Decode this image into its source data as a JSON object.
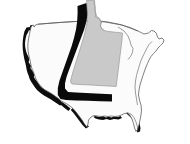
{
  "figure": {
    "title": "Map of the contiguous United States",
    "subject": "Idaho",
    "description": "Outline map of the contiguous United States with the state of Idaho shaded gray and offset with a heavy black drop shadow.",
    "width": 190,
    "height": 144,
    "background_color": "#ffffff"
  },
  "legend": {
    "nation_label": "Contiguous United States",
    "highlight_label": "Idaho",
    "shadow_label": "Drop shadow"
  },
  "colors": {
    "background": "#ffffff",
    "nation_fill": "#fbfbfb",
    "nation_outline": "#4a4a4a",
    "highlight_fill": "#c9c9c9",
    "highlight_outline": "#8d8d8d",
    "shadow": "#0d0d0d"
  },
  "regions": {
    "nation": "United States outline",
    "highlighted_state": "Idaho",
    "shadowed_edges": [
      "Pacific coast",
      "Southern border",
      "Gulf coast",
      "Florida peninsula",
      "Great Lakes",
      "New England coast"
    ]
  }
}
